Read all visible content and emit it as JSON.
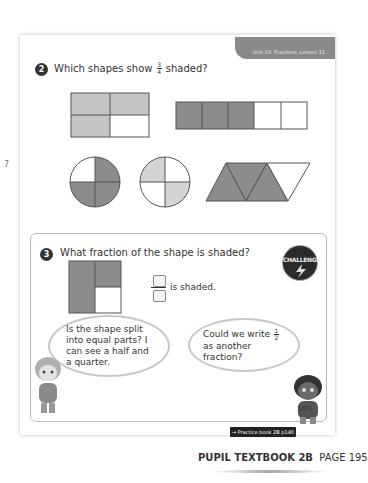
{
  "margin_fragment": "7",
  "header": {
    "lesson_label": "Unit 10: Fractions, Lesson 11"
  },
  "question2": {
    "number": "2",
    "text_before": "Which shapes show",
    "fraction": {
      "numerator": "3",
      "denominator": "4"
    },
    "text_after": "shaded?",
    "shapes": [
      {
        "id": "rect-2x2",
        "parts": 4,
        "shaded": 3
      },
      {
        "id": "strip-5",
        "parts": 5,
        "shaded": 3
      },
      {
        "id": "circle-a",
        "parts": 4,
        "shaded": 3
      },
      {
        "id": "circle-b",
        "parts": 4,
        "shaded": 2
      },
      {
        "id": "triangles",
        "parts": 4,
        "shaded": 3
      }
    ]
  },
  "question3": {
    "number": "3",
    "text": "What fraction of the shape is shaded?",
    "answer_suffix": "is shaded.",
    "challenge_badge": "CHALLENGE",
    "bubble_left": "Is the shape split into equal parts? I can see a half and a quarter.",
    "bubble_right_before": "Could we write",
    "bubble_right_fraction": {
      "numerator": "1",
      "denominator": "2"
    },
    "bubble_right_after": "as another fraction?"
  },
  "footer": {
    "page_number": "195",
    "practice_link": "→ Practice book 2B p140",
    "book_label": "PUPIL TEXTBOOK 2B",
    "page_label": "PAGE 195"
  },
  "colors": {
    "dark_shade": "#8c8c8c",
    "light_shade": "#c4c4c4",
    "outline": "#555555"
  }
}
